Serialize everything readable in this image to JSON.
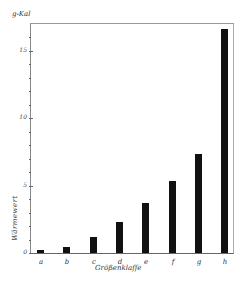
{
  "chart_data": {
    "type": "bar",
    "title": "",
    "unit_label": "g-Kal",
    "xlabel": "Größenklaſſe",
    "ylabel": "Wärmewert",
    "categories": [
      "a",
      "b",
      "c",
      "d",
      "e",
      "f",
      "g",
      "h"
    ],
    "values": [
      0.2,
      0.45,
      1.2,
      2.3,
      3.7,
      5.3,
      7.3,
      16.6
    ],
    "yticks": [
      0,
      5,
      10,
      15
    ],
    "ytick_labels": [
      "0",
      "5",
      "10",
      "15"
    ],
    "ylim": [
      0,
      17
    ],
    "grid": false,
    "legend": null,
    "bar_color": "#111111"
  }
}
